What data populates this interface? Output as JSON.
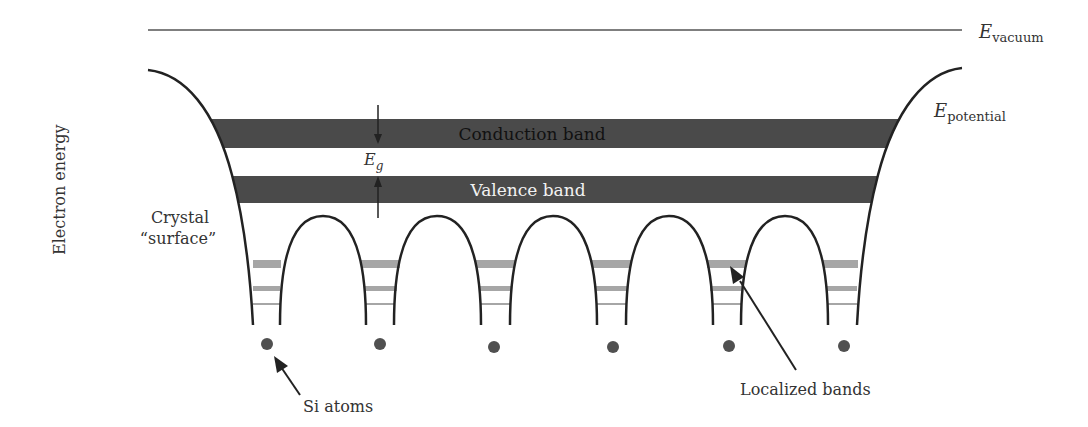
{
  "diagram": {
    "labels": {
      "e_vacuum_main": "E",
      "e_vacuum_sub": "vacuum",
      "e_potential_main": "E",
      "e_potential_sub": "potential",
      "axis_label": "Electron energy",
      "crystal_line1": "Crystal",
      "crystal_line2": "“surface”",
      "conduction_band": "Conduction band",
      "valence_band": "Valence band",
      "eg_main": "E",
      "eg_sub": "g",
      "si_atoms": "Si atoms",
      "localized_bands": "Localized bands"
    },
    "colors": {
      "band_dark": "#4a4a4a",
      "localized_band": "#a6a6a6",
      "curve": "#222222",
      "atom": "#505050",
      "vacuum_line": "#555555"
    },
    "atoms_count": 6,
    "arches_count": 5
  }
}
